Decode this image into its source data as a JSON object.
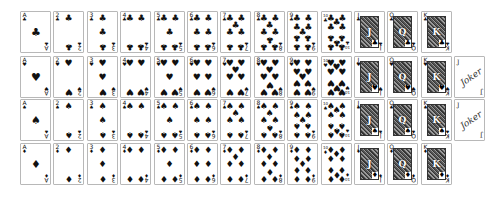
{
  "colors": {
    "card_border": "#b8b8b8",
    "ink": "#111111",
    "background": "#ffffff"
  },
  "layout": {
    "row_tops": [
      11,
      56,
      99,
      143
    ],
    "first_left": 20,
    "spacing": 33.4,
    "card_w": 31,
    "card_h": 42
  },
  "rows": [
    {
      "suit": "clubs",
      "symbol": "♣",
      "cards": [
        "A",
        "2",
        "3",
        "4",
        "5",
        "6",
        "7",
        "8",
        "9",
        "10",
        "J",
        "Q",
        "K"
      ],
      "joker": null
    },
    {
      "suit": "hearts",
      "symbol": "♥",
      "cards": [
        "A",
        "2",
        "3",
        "4",
        "5",
        "6",
        "7",
        "8",
        "9",
        "10",
        "J",
        "Q",
        "K"
      ],
      "joker": {
        "label": "Joker",
        "index": "J"
      }
    },
    {
      "suit": "spades",
      "symbol": "♠",
      "cards": [
        "A",
        "2",
        "3",
        "4",
        "5",
        "6",
        "7",
        "8",
        "9",
        "10",
        "J",
        "Q",
        "K"
      ],
      "joker": {
        "label": "Joker",
        "index": "J"
      }
    },
    {
      "suit": "diamonds",
      "symbol": "♦",
      "cards": [
        "A",
        "2",
        "3",
        "4",
        "5",
        "6",
        "7",
        "8",
        "9",
        "10",
        "J",
        "Q",
        "K"
      ],
      "joker": null
    }
  ]
}
